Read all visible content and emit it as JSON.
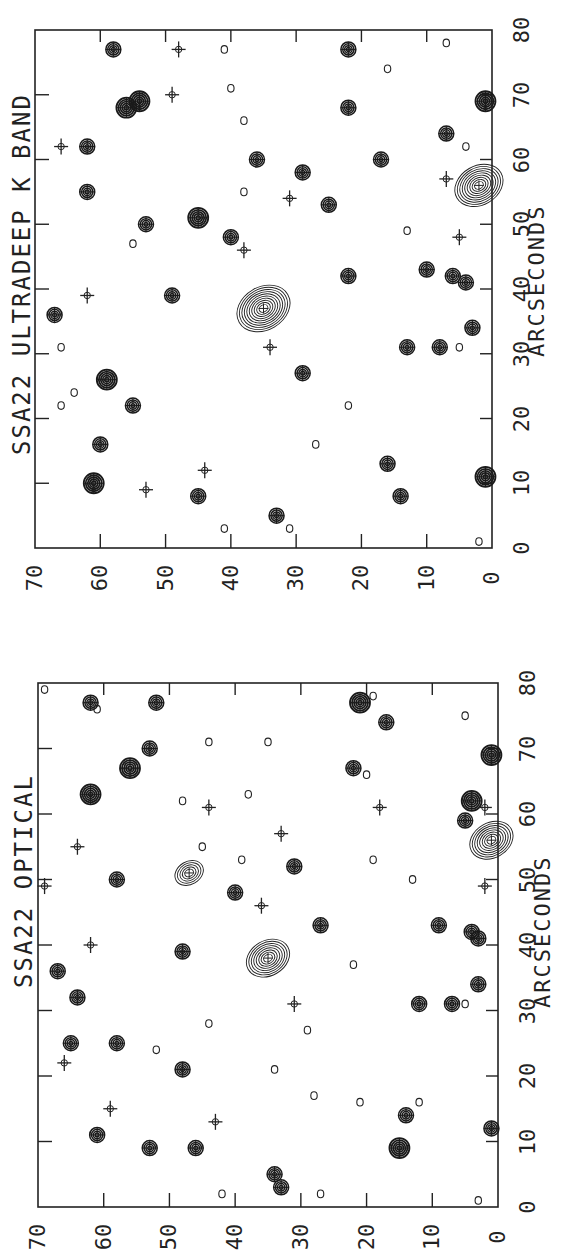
{
  "figure": {
    "panels": [
      {
        "id": "top",
        "title": "SSA22 ULTRADEEP K BAND",
        "xlabel": "ARCSECONDS",
        "x_ticks": [
          "0",
          "10",
          "20",
          "30",
          "40",
          "50",
          "60",
          "70",
          "80"
        ],
        "y_ticks": [
          "70",
          "60",
          "50",
          "40",
          "30",
          "20",
          "10",
          "0"
        ]
      },
      {
        "id": "bottom",
        "title": "SSA22 OPTICAL",
        "xlabel": "ARCSECONDS",
        "x_ticks": [
          "0",
          "10",
          "20",
          "30",
          "40",
          "50",
          "60",
          "70",
          "80"
        ],
        "y_ticks": [
          "70",
          "60",
          "50",
          "40",
          "30",
          "20",
          "10",
          "0"
        ]
      }
    ],
    "orientation": "rotated 90 degrees counter-clockwise on page"
  },
  "chart_data": [
    {
      "type": "scatter",
      "title": "SSA22 ULTRADEEP K BAND",
      "xlabel": "ARCSECONDS",
      "ylabel": "",
      "xlim": [
        0,
        80
      ],
      "ylim": [
        0,
        70
      ],
      "grid": false,
      "description": "Contour map of detected sources; crosses mark source positions",
      "sources": [
        {
          "x": 77,
          "y": 58,
          "size": "medium"
        },
        {
          "x": 77,
          "y": 48,
          "size": "cross"
        },
        {
          "x": 77,
          "y": 41,
          "size": "small"
        },
        {
          "x": 77,
          "y": 22,
          "size": "medium"
        },
        {
          "x": 78,
          "y": 7,
          "size": "small"
        },
        {
          "x": 74,
          "y": 16,
          "size": "small"
        },
        {
          "x": 70,
          "y": 49,
          "size": "cross"
        },
        {
          "x": 69,
          "y": 54,
          "size": "large"
        },
        {
          "x": 71,
          "y": 40,
          "size": "small"
        },
        {
          "x": 68,
          "y": 56,
          "size": "large"
        },
        {
          "x": 68,
          "y": 22,
          "size": "medium"
        },
        {
          "x": 69,
          "y": 1,
          "size": "large"
        },
        {
          "x": 66,
          "y": 38,
          "size": "small"
        },
        {
          "x": 64,
          "y": 7,
          "size": "medium"
        },
        {
          "x": 62,
          "y": 66,
          "size": "cross"
        },
        {
          "x": 62,
          "y": 62,
          "size": "medium"
        },
        {
          "x": 60,
          "y": 36,
          "size": "medium"
        },
        {
          "x": 60,
          "y": 17,
          "size": "medium"
        },
        {
          "x": 62,
          "y": 4,
          "size": "small"
        },
        {
          "x": 58,
          "y": 29,
          "size": "medium"
        },
        {
          "x": 57,
          "y": 7,
          "size": "cross"
        },
        {
          "x": 55,
          "y": 62,
          "size": "medium"
        },
        {
          "x": 55,
          "y": 38,
          "size": "small"
        },
        {
          "x": 54,
          "y": 31,
          "size": "cross"
        },
        {
          "x": 53,
          "y": 25,
          "size": "medium"
        },
        {
          "x": 56,
          "y": 2,
          "size": "extended",
          "levels": 9
        },
        {
          "x": 51,
          "y": 45,
          "size": "large"
        },
        {
          "x": 50,
          "y": 53,
          "size": "medium"
        },
        {
          "x": 49,
          "y": 13,
          "size": "small"
        },
        {
          "x": 48,
          "y": 40,
          "size": "medium"
        },
        {
          "x": 46,
          "y": 38,
          "size": "cross"
        },
        {
          "x": 48,
          "y": 5,
          "size": "cross"
        },
        {
          "x": 47,
          "y": 55,
          "size": "small"
        },
        {
          "x": 42,
          "y": 22,
          "size": "medium"
        },
        {
          "x": 43,
          "y": 10,
          "size": "medium"
        },
        {
          "x": 42,
          "y": 6,
          "size": "medium"
        },
        {
          "x": 41,
          "y": 4,
          "size": "medium"
        },
        {
          "x": 39,
          "y": 62,
          "size": "cross"
        },
        {
          "x": 39,
          "y": 49,
          "size": "medium"
        },
        {
          "x": 37,
          "y": 35,
          "size": "extended",
          "levels": 10
        },
        {
          "x": 36,
          "y": 67,
          "size": "medium"
        },
        {
          "x": 34,
          "y": 3,
          "size": "medium"
        },
        {
          "x": 31,
          "y": 66,
          "size": "small"
        },
        {
          "x": 31,
          "y": 34,
          "size": "cross"
        },
        {
          "x": 31,
          "y": 13,
          "size": "medium"
        },
        {
          "x": 31,
          "y": 8,
          "size": "medium"
        },
        {
          "x": 31,
          "y": 5,
          "size": "small"
        },
        {
          "x": 27,
          "y": 29,
          "size": "medium"
        },
        {
          "x": 26,
          "y": 59,
          "size": "large"
        },
        {
          "x": 24,
          "y": 64,
          "size": "small"
        },
        {
          "x": 22,
          "y": 66,
          "size": "small"
        },
        {
          "x": 22,
          "y": 22,
          "size": "small"
        },
        {
          "x": 22,
          "y": 55,
          "size": "medium"
        },
        {
          "x": 16,
          "y": 60,
          "size": "medium"
        },
        {
          "x": 16,
          "y": 27,
          "size": "small"
        },
        {
          "x": 12,
          "y": 44,
          "size": "cross"
        },
        {
          "x": 13,
          "y": 16,
          "size": "medium"
        },
        {
          "x": 11,
          "y": 1,
          "size": "large"
        },
        {
          "x": 10,
          "y": 61,
          "size": "large"
        },
        {
          "x": 9,
          "y": 53,
          "size": "cross"
        },
        {
          "x": 8,
          "y": 45,
          "size": "medium"
        },
        {
          "x": 8,
          "y": 14,
          "size": "medium"
        },
        {
          "x": 5,
          "y": 33,
          "size": "medium"
        },
        {
          "x": 3,
          "y": 31,
          "size": "small"
        },
        {
          "x": 3,
          "y": 41,
          "size": "small"
        },
        {
          "x": 1,
          "y": 2,
          "size": "small"
        }
      ]
    },
    {
      "type": "scatter",
      "title": "SSA22 OPTICAL",
      "xlabel": "ARCSECONDS",
      "ylabel": "",
      "xlim": [
        0,
        80
      ],
      "ylim": [
        0,
        70
      ],
      "grid": false,
      "description": "Contour map of detected sources; crosses mark K-band source positions",
      "sources": [
        {
          "x": 79,
          "y": 69,
          "size": "small"
        },
        {
          "x": 77,
          "y": 62,
          "size": "medium"
        },
        {
          "x": 76,
          "y": 61,
          "size": "small"
        },
        {
          "x": 77,
          "y": 52,
          "size": "medium"
        },
        {
          "x": 77,
          "y": 21,
          "size": "large"
        },
        {
          "x": 78,
          "y": 19,
          "size": "small"
        },
        {
          "x": 74,
          "y": 17,
          "size": "medium"
        },
        {
          "x": 75,
          "y": 5,
          "size": "small"
        },
        {
          "x": 71,
          "y": 44,
          "size": "small"
        },
        {
          "x": 71,
          "y": 35,
          "size": "small"
        },
        {
          "x": 69,
          "y": 1,
          "size": "large"
        },
        {
          "x": 70,
          "y": 53,
          "size": "medium"
        },
        {
          "x": 67,
          "y": 56,
          "size": "large"
        },
        {
          "x": 67,
          "y": 22,
          "size": "medium"
        },
        {
          "x": 66,
          "y": 20,
          "size": "small"
        },
        {
          "x": 63,
          "y": 62,
          "size": "large"
        },
        {
          "x": 62,
          "y": 48,
          "size": "small"
        },
        {
          "x": 63,
          "y": 38,
          "size": "small"
        },
        {
          "x": 62,
          "y": 4,
          "size": "large"
        },
        {
          "x": 61,
          "y": 44,
          "size": "cross"
        },
        {
          "x": 61,
          "y": 18,
          "size": "cross"
        },
        {
          "x": 61,
          "y": 2,
          "size": "cross"
        },
        {
          "x": 59,
          "y": 5,
          "size": "medium"
        },
        {
          "x": 57,
          "y": 33,
          "size": "cross"
        },
        {
          "x": 56,
          "y": 1,
          "size": "extended",
          "levels": 8
        },
        {
          "x": 55,
          "y": 64,
          "size": "cross"
        },
        {
          "x": 55,
          "y": 45,
          "size": "small"
        },
        {
          "x": 53,
          "y": 39,
          "size": "small"
        },
        {
          "x": 53,
          "y": 19,
          "size": "small"
        },
        {
          "x": 52,
          "y": 31,
          "size": "medium"
        },
        {
          "x": 51,
          "y": 47,
          "size": "extended",
          "levels": 5
        },
        {
          "x": 50,
          "y": 58,
          "size": "medium"
        },
        {
          "x": 50,
          "y": 13,
          "size": "small"
        },
        {
          "x": 48,
          "y": 40,
          "size": "medium"
        },
        {
          "x": 49,
          "y": 69,
          "size": "cross"
        },
        {
          "x": 49,
          "y": 2,
          "size": "cross"
        },
        {
          "x": 46,
          "y": 36,
          "size": "cross"
        },
        {
          "x": 43,
          "y": 27,
          "size": "medium"
        },
        {
          "x": 43,
          "y": 9,
          "size": "medium"
        },
        {
          "x": 42,
          "y": 4,
          "size": "medium"
        },
        {
          "x": 41,
          "y": 3,
          "size": "medium"
        },
        {
          "x": 40,
          "y": 62,
          "size": "cross"
        },
        {
          "x": 39,
          "y": 48,
          "size": "medium"
        },
        {
          "x": 38,
          "y": 35,
          "size": "extended",
          "levels": 8
        },
        {
          "x": 37,
          "y": 22,
          "size": "small"
        },
        {
          "x": 36,
          "y": 67,
          "size": "medium"
        },
        {
          "x": 34,
          "y": 3,
          "size": "medium"
        },
        {
          "x": 32,
          "y": 64,
          "size": "medium"
        },
        {
          "x": 31,
          "y": 12,
          "size": "medium"
        },
        {
          "x": 31,
          "y": 7,
          "size": "medium"
        },
        {
          "x": 31,
          "y": 5,
          "size": "small"
        },
        {
          "x": 31,
          "y": 31,
          "size": "cross"
        },
        {
          "x": 28,
          "y": 44,
          "size": "small"
        },
        {
          "x": 27,
          "y": 29,
          "size": "small"
        },
        {
          "x": 25,
          "y": 65,
          "size": "medium"
        },
        {
          "x": 25,
          "y": 58,
          "size": "medium"
        },
        {
          "x": 24,
          "y": 52,
          "size": "small"
        },
        {
          "x": 22,
          "y": 66,
          "size": "cross"
        },
        {
          "x": 21,
          "y": 48,
          "size": "medium"
        },
        {
          "x": 21,
          "y": 34,
          "size": "small"
        },
        {
          "x": 17,
          "y": 28,
          "size": "small"
        },
        {
          "x": 16,
          "y": 21,
          "size": "small"
        },
        {
          "x": 16,
          "y": 12,
          "size": "small"
        },
        {
          "x": 15,
          "y": 59,
          "size": "cross"
        },
        {
          "x": 14,
          "y": 14,
          "size": "medium"
        },
        {
          "x": 13,
          "y": 43,
          "size": "cross"
        },
        {
          "x": 12,
          "y": 1,
          "size": "medium"
        },
        {
          "x": 11,
          "y": 61,
          "size": "medium"
        },
        {
          "x": 9,
          "y": 53,
          "size": "medium"
        },
        {
          "x": 9,
          "y": 46,
          "size": "medium"
        },
        {
          "x": 9,
          "y": 15,
          "size": "large"
        },
        {
          "x": 5,
          "y": 34,
          "size": "medium"
        },
        {
          "x": 3,
          "y": 33,
          "size": "medium"
        },
        {
          "x": 2,
          "y": 42,
          "size": "small"
        },
        {
          "x": 2,
          "y": 27,
          "size": "small"
        },
        {
          "x": 1,
          "y": 3,
          "size": "small"
        }
      ]
    }
  ]
}
